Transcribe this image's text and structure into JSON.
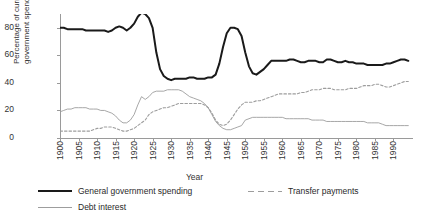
{
  "chart_data": {
    "type": "line",
    "title": "",
    "xlabel": "Year",
    "ylabel": "Percentage of current government spending",
    "ylabel_line1": "Percentage of current",
    "ylabel_line2": "government spending",
    "xlim": [
      1900,
      1995
    ],
    "ylim": [
      0,
      90
    ],
    "yticks": [
      0,
      20,
      40,
      60,
      80
    ],
    "ytick_labels": [
      "0",
      "20",
      "40",
      "60",
      "80"
    ],
    "xticks": [
      1900,
      1905,
      1910,
      1915,
      1920,
      1925,
      1930,
      1935,
      1940,
      1945,
      1950,
      1955,
      1960,
      1965,
      1970,
      1975,
      1980,
      1985,
      1990
    ],
    "xtick_labels": [
      "1900",
      "1905",
      "1910",
      "1915",
      "1920",
      "1925",
      "1930",
      "1935",
      "1940",
      "1945",
      "1950",
      "1955",
      "1960",
      "1965",
      "1970",
      "1975",
      "1980",
      "1985",
      "1990"
    ],
    "grid": false,
    "legend_position": "below",
    "colors": {
      "general_government_spending": "#1a1a1a",
      "transfer_payments": "#9d9d9d",
      "debt_interest": "#9d9d9d",
      "axis": "#9a9a9a",
      "text": "#2a2a2a",
      "background": "#ffffff"
    },
    "series": [
      {
        "name": "General government spending",
        "style": "solid-thick",
        "color": "#1a1a1a",
        "x": [
          1900,
          1901,
          1902,
          1903,
          1904,
          1905,
          1906,
          1907,
          1908,
          1909,
          1910,
          1911,
          1912,
          1913,
          1914,
          1915,
          1916,
          1917,
          1918,
          1919,
          1920,
          1921,
          1922,
          1923,
          1924,
          1925,
          1926,
          1927,
          1928,
          1929,
          1930,
          1931,
          1932,
          1933,
          1934,
          1935,
          1936,
          1937,
          1938,
          1939,
          1940,
          1941,
          1942,
          1943,
          1944,
          1945,
          1946,
          1947,
          1948,
          1949,
          1950,
          1951,
          1952,
          1953,
          1954,
          1955,
          1956,
          1957,
          1958,
          1959,
          1960,
          1961,
          1962,
          1963,
          1964,
          1965,
          1966,
          1967,
          1968,
          1969,
          1970,
          1971,
          1972,
          1973,
          1974,
          1975,
          1976,
          1977,
          1978,
          1979,
          1980,
          1981,
          1982,
          1983,
          1984,
          1985,
          1986,
          1987,
          1988,
          1989,
          1990,
          1991,
          1992,
          1993,
          1994
        ],
        "values": [
          80,
          80,
          79,
          79,
          79,
          79,
          79,
          78,
          78,
          78,
          78,
          78,
          78,
          77,
          78,
          80,
          81,
          80,
          78,
          80,
          83,
          88,
          91,
          90,
          87,
          80,
          62,
          50,
          45,
          43,
          42,
          43,
          43,
          43,
          43,
          44,
          44,
          43,
          43,
          43,
          44,
          44,
          46,
          54,
          66,
          76,
          80,
          80,
          79,
          74,
          62,
          52,
          47,
          46,
          48,
          50,
          53,
          56,
          56,
          56,
          56,
          56,
          57,
          57,
          56,
          55,
          55,
          56,
          56,
          56,
          55,
          55,
          57,
          57,
          56,
          55,
          55,
          56,
          55,
          55,
          54,
          54,
          54,
          53,
          53,
          53,
          53,
          53,
          54,
          54,
          55,
          56,
          57,
          57,
          56
        ]
      },
      {
        "name": "Transfer payments",
        "style": "dashed",
        "color": "#9d9d9d",
        "x": [
          1900,
          1901,
          1902,
          1903,
          1904,
          1905,
          1906,
          1907,
          1908,
          1909,
          1910,
          1911,
          1912,
          1913,
          1914,
          1915,
          1916,
          1917,
          1918,
          1919,
          1920,
          1921,
          1922,
          1923,
          1924,
          1925,
          1926,
          1927,
          1928,
          1929,
          1930,
          1931,
          1932,
          1933,
          1934,
          1935,
          1936,
          1937,
          1938,
          1939,
          1940,
          1941,
          1942,
          1943,
          1944,
          1945,
          1946,
          1947,
          1948,
          1949,
          1950,
          1951,
          1952,
          1953,
          1954,
          1955,
          1956,
          1957,
          1958,
          1959,
          1960,
          1961,
          1962,
          1963,
          1964,
          1965,
          1966,
          1967,
          1968,
          1969,
          1970,
          1971,
          1972,
          1973,
          1974,
          1975,
          1976,
          1977,
          1978,
          1979,
          1980,
          1981,
          1982,
          1983,
          1984,
          1985,
          1986,
          1987,
          1988,
          1989,
          1990,
          1991,
          1992,
          1993,
          1994
        ],
        "values": [
          5,
          5,
          5,
          5,
          5,
          5,
          5,
          5,
          5,
          6,
          7,
          7,
          8,
          8,
          8,
          7,
          6,
          5,
          5,
          6,
          7,
          9,
          11,
          13,
          17,
          19,
          20,
          21,
          22,
          22,
          23,
          24,
          25,
          25,
          25,
          25,
          25,
          25,
          25,
          24,
          22,
          18,
          13,
          10,
          9,
          10,
          13,
          17,
          21,
          24,
          26,
          26,
          26,
          27,
          27,
          28,
          29,
          30,
          31,
          32,
          32,
          32,
          32,
          32,
          32,
          33,
          33,
          34,
          35,
          35,
          35,
          36,
          36,
          36,
          35,
          35,
          35,
          35,
          36,
          36,
          36,
          37,
          38,
          38,
          38,
          39,
          39,
          38,
          37,
          37,
          38,
          39,
          40,
          41,
          41
        ]
      },
      {
        "name": "Debt interest",
        "style": "solid-thin",
        "color": "#9d9d9d",
        "x": [
          1900,
          1901,
          1902,
          1903,
          1904,
          1905,
          1906,
          1907,
          1908,
          1909,
          1910,
          1911,
          1912,
          1913,
          1914,
          1915,
          1916,
          1917,
          1918,
          1919,
          1920,
          1921,
          1922,
          1923,
          1924,
          1925,
          1926,
          1927,
          1928,
          1929,
          1930,
          1931,
          1932,
          1933,
          1934,
          1935,
          1936,
          1937,
          1938,
          1939,
          1940,
          1941,
          1942,
          1943,
          1944,
          1945,
          1946,
          1947,
          1948,
          1949,
          1950,
          1951,
          1952,
          1953,
          1954,
          1955,
          1956,
          1957,
          1958,
          1959,
          1960,
          1961,
          1962,
          1963,
          1964,
          1965,
          1966,
          1967,
          1968,
          1969,
          1970,
          1971,
          1972,
          1973,
          1974,
          1975,
          1976,
          1977,
          1978,
          1979,
          1980,
          1981,
          1982,
          1983,
          1984,
          1985,
          1986,
          1987,
          1988,
          1989,
          1990,
          1991,
          1992,
          1993,
          1994
        ],
        "values": [
          19,
          20,
          21,
          21,
          22,
          22,
          22,
          22,
          21,
          21,
          21,
          20,
          20,
          19,
          18,
          16,
          13,
          11,
          11,
          13,
          17,
          24,
          30,
          28,
          30,
          33,
          34,
          34,
          34,
          35,
          35,
          35,
          35,
          34,
          32,
          30,
          29,
          28,
          27,
          25,
          22,
          17,
          12,
          9,
          7,
          6,
          6,
          7,
          8,
          9,
          13,
          14,
          15,
          15,
          15,
          15,
          15,
          15,
          15,
          15,
          15,
          14,
          14,
          14,
          14,
          14,
          14,
          14,
          13,
          13,
          13,
          13,
          12,
          12,
          12,
          12,
          12,
          12,
          12,
          12,
          12,
          12,
          12,
          11,
          11,
          11,
          11,
          10,
          9,
          9,
          9,
          9,
          9,
          9,
          9
        ]
      }
    ],
    "legend": [
      {
        "label": "General government spending",
        "style": "solid-thick"
      },
      {
        "label": "Debt interest",
        "style": "solid-thin"
      },
      {
        "label": "Transfer payments",
        "style": "dashed"
      }
    ]
  }
}
